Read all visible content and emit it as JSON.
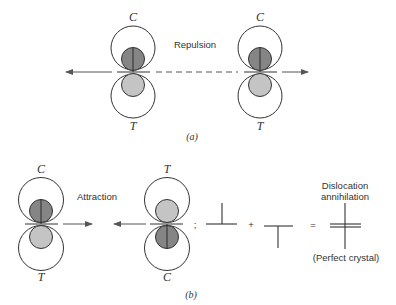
{
  "colors": {
    "compression_core": "#858585",
    "tension_core": "#c4c4c4",
    "line": "#333333"
  },
  "part_a": {
    "caption": "(a)",
    "interaction_label": "Repulsion",
    "dislocations": [
      {
        "top_label": "C",
        "bottom_label": "T"
      },
      {
        "top_label": "C",
        "bottom_label": "T"
      }
    ]
  },
  "part_b": {
    "caption": "(b)",
    "interaction_label": "Attraction",
    "dislocations": [
      {
        "top_label": "C",
        "bottom_label": "T"
      },
      {
        "top_label": "T",
        "bottom_label": "C"
      }
    ],
    "equation": {
      "separator": ";",
      "plus": "+",
      "equals": "=",
      "result_title_line1": "Dislocation",
      "result_title_line2": "annihilation",
      "result_caption": "(Perfect crystal)"
    }
  }
}
